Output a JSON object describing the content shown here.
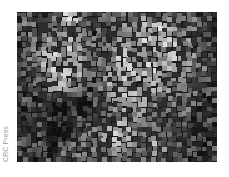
{
  "image": {
    "description": "Grayscale mosaic-like texture of small bright and dark squares",
    "credit": "CRC Press",
    "colors": {
      "background": "#1a1a1a",
      "credit_text": "#9a9a9a",
      "page": "#ffffff"
    },
    "grid": {
      "cols": 40,
      "rows": 30,
      "tile_px": 5
    },
    "brightness_map": [
      [
        2,
        2,
        3,
        3,
        3,
        2,
        3,
        3,
        4,
        6,
        7,
        6,
        5,
        3,
        3,
        4,
        3,
        3,
        3,
        3,
        3,
        3,
        3,
        3,
        3,
        3,
        3,
        2,
        3,
        3,
        3,
        3,
        3,
        3,
        3,
        3,
        2,
        2,
        2,
        2
      ],
      [
        2,
        3,
        3,
        3,
        3,
        3,
        3,
        4,
        5,
        7,
        8,
        7,
        5,
        4,
        3,
        3,
        3,
        3,
        3,
        3,
        3,
        3,
        4,
        4,
        4,
        5,
        5,
        4,
        4,
        4,
        4,
        3,
        3,
        3,
        3,
        3,
        3,
        2,
        2,
        2
      ],
      [
        2,
        3,
        3,
        3,
        3,
        3,
        3,
        4,
        4,
        5,
        6,
        5,
        4,
        3,
        3,
        3,
        3,
        3,
        3,
        3,
        3,
        4,
        4,
        5,
        5,
        6,
        6,
        6,
        5,
        5,
        4,
        4,
        3,
        3,
        3,
        3,
        3,
        2,
        2,
        2
      ],
      [
        2,
        3,
        3,
        3,
        3,
        3,
        3,
        4,
        4,
        4,
        5,
        4,
        3,
        3,
        3,
        3,
        3,
        3,
        3,
        3,
        4,
        4,
        5,
        5,
        6,
        6,
        6,
        6,
        6,
        5,
        5,
        4,
        4,
        3,
        3,
        3,
        3,
        3,
        2,
        2
      ],
      [
        2,
        3,
        3,
        3,
        3,
        3,
        3,
        3,
        4,
        5,
        5,
        5,
        4,
        3,
        3,
        2,
        3,
        3,
        3,
        3,
        4,
        5,
        5,
        6,
        6,
        7,
        6,
        6,
        6,
        6,
        5,
        5,
        4,
        4,
        3,
        3,
        3,
        3,
        2,
        2
      ],
      [
        2,
        3,
        3,
        3,
        3,
        3,
        4,
        4,
        5,
        5,
        5,
        5,
        4,
        3,
        3,
        3,
        3,
        3,
        3,
        4,
        5,
        5,
        6,
        6,
        6,
        6,
        6,
        6,
        6,
        6,
        6,
        5,
        5,
        4,
        4,
        3,
        3,
        3,
        2,
        2
      ],
      [
        2,
        3,
        3,
        3,
        3,
        4,
        4,
        5,
        5,
        6,
        5,
        5,
        4,
        3,
        3,
        3,
        3,
        3,
        4,
        4,
        5,
        6,
        6,
        6,
        5,
        5,
        5,
        6,
        6,
        6,
        6,
        6,
        5,
        5,
        4,
        4,
        3,
        3,
        2,
        2
      ],
      [
        2,
        2,
        3,
        3,
        4,
        4,
        5,
        5,
        6,
        6,
        6,
        5,
        5,
        4,
        3,
        3,
        3,
        3,
        4,
        5,
        5,
        6,
        6,
        5,
        4,
        4,
        5,
        5,
        6,
        6,
        6,
        6,
        6,
        5,
        4,
        4,
        3,
        3,
        2,
        2
      ],
      [
        2,
        2,
        3,
        3,
        4,
        5,
        5,
        6,
        6,
        6,
        6,
        5,
        5,
        4,
        3,
        3,
        3,
        3,
        4,
        5,
        6,
        6,
        5,
        4,
        4,
        4,
        4,
        5,
        5,
        6,
        6,
        6,
        6,
        5,
        5,
        4,
        3,
        3,
        2,
        2
      ],
      [
        2,
        2,
        3,
        3,
        4,
        5,
        5,
        6,
        6,
        6,
        6,
        6,
        5,
        4,
        3,
        3,
        3,
        4,
        4,
        5,
        6,
        6,
        5,
        5,
        5,
        5,
        5,
        5,
        5,
        6,
        6,
        6,
        6,
        5,
        5,
        4,
        3,
        3,
        2,
        2
      ],
      [
        2,
        2,
        3,
        3,
        4,
        5,
        6,
        6,
        6,
        7,
        6,
        6,
        5,
        4,
        3,
        3,
        3,
        4,
        5,
        5,
        6,
        6,
        6,
        6,
        6,
        6,
        6,
        6,
        6,
        6,
        6,
        6,
        5,
        5,
        4,
        4,
        3,
        3,
        2,
        2
      ],
      [
        2,
        2,
        3,
        3,
        4,
        5,
        6,
        6,
        7,
        7,
        6,
        6,
        5,
        4,
        3,
        3,
        3,
        4,
        5,
        6,
        6,
        6,
        6,
        6,
        6,
        6,
        6,
        6,
        6,
        6,
        6,
        5,
        5,
        4,
        4,
        3,
        3,
        3,
        2,
        2
      ],
      [
        2,
        2,
        3,
        3,
        4,
        5,
        5,
        6,
        6,
        6,
        6,
        5,
        5,
        4,
        3,
        3,
        3,
        4,
        5,
        6,
        6,
        6,
        6,
        6,
        6,
        6,
        6,
        6,
        6,
        6,
        5,
        5,
        4,
        4,
        3,
        3,
        3,
        3,
        2,
        2
      ],
      [
        2,
        2,
        3,
        3,
        4,
        4,
        5,
        5,
        6,
        6,
        5,
        5,
        4,
        3,
        3,
        2,
        3,
        4,
        5,
        6,
        6,
        6,
        6,
        6,
        6,
        6,
        6,
        6,
        6,
        5,
        5,
        4,
        4,
        3,
        3,
        3,
        3,
        3,
        2,
        2
      ],
      [
        2,
        2,
        2,
        3,
        3,
        4,
        4,
        5,
        5,
        5,
        5,
        4,
        4,
        3,
        2,
        2,
        3,
        4,
        5,
        6,
        6,
        6,
        6,
        6,
        6,
        6,
        6,
        6,
        5,
        5,
        4,
        4,
        3,
        3,
        3,
        3,
        3,
        3,
        2,
        2
      ],
      [
        2,
        2,
        2,
        3,
        3,
        3,
        4,
        4,
        5,
        5,
        4,
        4,
        3,
        2,
        2,
        2,
        3,
        4,
        5,
        5,
        6,
        6,
        6,
        6,
        6,
        6,
        6,
        5,
        5,
        4,
        4,
        3,
        3,
        3,
        3,
        3,
        3,
        2,
        2,
        2
      ],
      [
        2,
        2,
        2,
        2,
        3,
        3,
        3,
        3,
        3,
        3,
        3,
        3,
        2,
        2,
        2,
        2,
        3,
        4,
        4,
        5,
        5,
        6,
        6,
        6,
        6,
        6,
        5,
        5,
        4,
        4,
        3,
        3,
        3,
        3,
        3,
        3,
        3,
        2,
        2,
        2
      ],
      [
        2,
        2,
        2,
        2,
        2,
        2,
        2,
        2,
        2,
        2,
        2,
        2,
        2,
        1,
        1,
        2,
        3,
        3,
        4,
        5,
        5,
        5,
        6,
        6,
        6,
        5,
        5,
        4,
        4,
        3,
        3,
        3,
        3,
        3,
        3,
        3,
        2,
        2,
        2,
        2
      ],
      [
        2,
        2,
        2,
        2,
        2,
        2,
        2,
        1,
        1,
        1,
        1,
        1,
        1,
        1,
        1,
        2,
        3,
        3,
        4,
        4,
        5,
        5,
        5,
        5,
        5,
        5,
        4,
        4,
        3,
        3,
        3,
        3,
        3,
        3,
        3,
        3,
        2,
        2,
        2,
        2
      ],
      [
        2,
        2,
        2,
        2,
        2,
        2,
        1,
        1,
        1,
        1,
        1,
        1,
        1,
        1,
        2,
        2,
        3,
        3,
        4,
        4,
        4,
        5,
        5,
        5,
        4,
        4,
        4,
        3,
        3,
        3,
        3,
        3,
        3,
        3,
        3,
        2,
        2,
        2,
        2,
        2
      ],
      [
        2,
        2,
        2,
        2,
        2,
        1,
        1,
        1,
        1,
        1,
        1,
        1,
        1,
        2,
        2,
        3,
        3,
        3,
        3,
        4,
        4,
        4,
        4,
        4,
        4,
        3,
        3,
        3,
        3,
        3,
        3,
        3,
        3,
        3,
        2,
        2,
        2,
        2,
        2,
        2
      ],
      [
        2,
        2,
        2,
        2,
        2,
        1,
        1,
        1,
        1,
        1,
        1,
        1,
        2,
        2,
        2,
        3,
        3,
        3,
        3,
        3,
        4,
        4,
        4,
        4,
        3,
        3,
        3,
        3,
        3,
        3,
        3,
        3,
        3,
        3,
        2,
        2,
        2,
        2,
        2,
        2
      ],
      [
        2,
        2,
        2,
        2,
        2,
        2,
        1,
        1,
        1,
        1,
        1,
        2,
        2,
        2,
        3,
        3,
        3,
        3,
        4,
        5,
        5,
        5,
        4,
        3,
        3,
        3,
        3,
        3,
        3,
        3,
        3,
        3,
        3,
        2,
        2,
        2,
        2,
        2,
        2,
        2
      ],
      [
        2,
        2,
        2,
        2,
        2,
        2,
        1,
        1,
        1,
        1,
        1,
        2,
        2,
        3,
        3,
        3,
        3,
        4,
        5,
        6,
        6,
        6,
        5,
        4,
        3,
        3,
        3,
        3,
        3,
        3,
        3,
        3,
        3,
        2,
        2,
        2,
        2,
        2,
        2,
        2
      ],
      [
        2,
        2,
        2,
        2,
        2,
        2,
        2,
        1,
        1,
        1,
        2,
        2,
        3,
        3,
        3,
        3,
        4,
        5,
        6,
        6,
        6,
        6,
        6,
        5,
        4,
        3,
        3,
        3,
        3,
        3,
        3,
        3,
        2,
        2,
        2,
        2,
        2,
        2,
        2,
        2
      ],
      [
        2,
        2,
        2,
        2,
        2,
        2,
        2,
        2,
        1,
        1,
        2,
        2,
        3,
        3,
        3,
        3,
        4,
        5,
        6,
        6,
        6,
        6,
        5,
        4,
        3,
        3,
        3,
        4,
        4,
        3,
        3,
        3,
        2,
        2,
        2,
        2,
        2,
        2,
        2,
        2
      ],
      [
        2,
        2,
        2,
        2,
        2,
        2,
        2,
        2,
        2,
        2,
        2,
        3,
        3,
        3,
        3,
        3,
        4,
        5,
        5,
        6,
        6,
        5,
        4,
        3,
        3,
        3,
        4,
        5,
        5,
        4,
        3,
        3,
        2,
        2,
        2,
        2,
        2,
        2,
        2,
        2
      ],
      [
        2,
        2,
        2,
        2,
        2,
        2,
        2,
        2,
        2,
        2,
        3,
        3,
        4,
        4,
        3,
        3,
        3,
        4,
        5,
        5,
        5,
        4,
        3,
        3,
        3,
        3,
        4,
        5,
        5,
        4,
        3,
        2,
        2,
        2,
        2,
        2,
        2,
        2,
        2,
        2
      ],
      [
        2,
        2,
        2,
        2,
        2,
        2,
        2,
        2,
        2,
        3,
        3,
        4,
        5,
        5,
        4,
        3,
        3,
        3,
        4,
        4,
        4,
        3,
        3,
        3,
        3,
        3,
        3,
        4,
        4,
        3,
        3,
        2,
        2,
        2,
        2,
        2,
        2,
        2,
        2,
        2
      ],
      [
        2,
        2,
        2,
        2,
        2,
        2,
        2,
        2,
        2,
        2,
        3,
        3,
        4,
        4,
        3,
        3,
        3,
        3,
        3,
        3,
        3,
        3,
        3,
        3,
        3,
        3,
        3,
        3,
        3,
        3,
        2,
        2,
        2,
        2,
        2,
        2,
        2,
        2,
        2,
        2
      ]
    ]
  }
}
